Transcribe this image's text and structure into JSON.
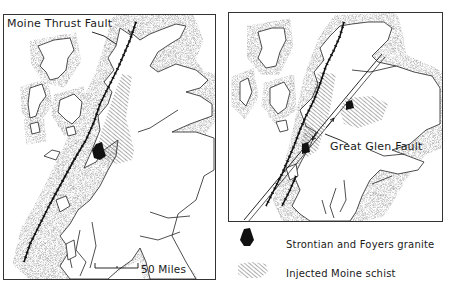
{
  "figure": {
    "left_map": {
      "label": "Moine Thrust Fault",
      "scale_bar": {
        "label": "50 Miles",
        "value": 50,
        "unit": "Miles"
      }
    },
    "right_map": {
      "label": "Great Glen Fault"
    },
    "legend": [
      {
        "symbol": "solid-black-blob",
        "label": "Strontian and Foyers granite"
      },
      {
        "symbol": "hatched-area",
        "label": "Injected Moine schist"
      }
    ],
    "colors": {
      "ink": "#111111",
      "stipple": "#9a9a9a",
      "frame": "#333333",
      "background": "#ffffff"
    }
  }
}
